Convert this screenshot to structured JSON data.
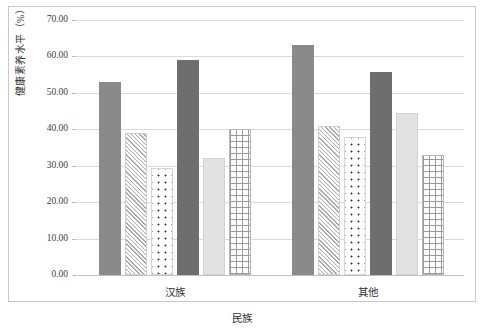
{
  "chart_data": {
    "type": "bar",
    "title": "",
    "xlabel": "民族",
    "ylabel": "健康素养水平（%）",
    "categories": [
      "汉族",
      "其他"
    ],
    "ylim": [
      0,
      70
    ],
    "ytick_step": 10,
    "ytick_labels": [
      "0.00",
      "10.00",
      "20.00",
      "30.00",
      "40.00",
      "50.00",
      "60.00",
      "70.00"
    ],
    "ytick_values": [
      0,
      10,
      20,
      30,
      40,
      50,
      60,
      70
    ],
    "grid": true,
    "legend": "none",
    "series": [
      {
        "name": "series-1",
        "pattern": "solid-mid",
        "values": [
          53.1,
          63.2
        ]
      },
      {
        "name": "series-2",
        "pattern": "diagonal",
        "values": [
          39.0,
          40.8
        ]
      },
      {
        "name": "series-3",
        "pattern": "dots",
        "values": [
          29.4,
          37.8
        ]
      },
      {
        "name": "series-4",
        "pattern": "solid-dark",
        "values": [
          59.0,
          55.8
        ]
      },
      {
        "name": "series-5",
        "pattern": "solid-light",
        "values": [
          32.0,
          44.5
        ]
      },
      {
        "name": "series-6",
        "pattern": "grid",
        "values": [
          40.2,
          33.0
        ]
      }
    ],
    "colors": {
      "solid_mid": "#8a8a8a",
      "solid_dark": "#6e6e6e",
      "solid_light": "#e2e2e2",
      "pattern_line": "#9a9a9a",
      "gridline": "#d9d9d9",
      "frame": "#c8c8c8",
      "text": "#2e2e2e"
    }
  }
}
